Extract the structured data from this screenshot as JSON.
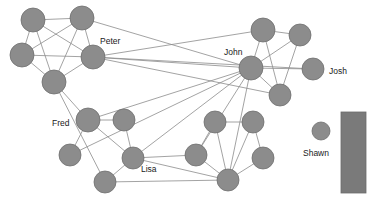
{
  "figure": {
    "width": 371,
    "height": 208,
    "background_color": "#ffffff"
  },
  "style": {
    "node_fill": "#8c8c8c",
    "node_stroke": "#6e6e6e",
    "edge_color": "#8c8c8c",
    "label_color": "#1a1a1a",
    "legend_fill": "#7a7a7a"
  },
  "labels": {
    "peter": "Peter",
    "john": "John",
    "josh": "Josh",
    "fred": "Fred",
    "lisa": "Lisa",
    "shawn": "Shawn"
  },
  "chart_data": {
    "type": "network",
    "node_count": 22,
    "edge_count": 42,
    "nodes": [
      {
        "id": "n1",
        "x": 33,
        "y": 20,
        "r": 12,
        "label": ""
      },
      {
        "id": "n2",
        "x": 82,
        "y": 18,
        "r": 12,
        "label": ""
      },
      {
        "id": "n3",
        "x": 22,
        "y": 55,
        "r": 12,
        "label": ""
      },
      {
        "id": "n4",
        "x": 93,
        "y": 57,
        "r": 12,
        "label": "Peter"
      },
      {
        "id": "n5",
        "x": 54,
        "y": 82,
        "r": 12,
        "label": ""
      },
      {
        "id": "n6",
        "x": 263,
        "y": 30,
        "r": 12,
        "label": ""
      },
      {
        "id": "n7",
        "x": 300,
        "y": 35,
        "r": 11,
        "label": ""
      },
      {
        "id": "n8",
        "x": 251,
        "y": 68,
        "r": 12,
        "label": "John"
      },
      {
        "id": "n9",
        "x": 313,
        "y": 69,
        "r": 11,
        "label": "Josh"
      },
      {
        "id": "n10",
        "x": 280,
        "y": 95,
        "r": 11,
        "label": ""
      },
      {
        "id": "n11",
        "x": 88,
        "y": 120,
        "r": 12,
        "label": "Fred"
      },
      {
        "id": "n12",
        "x": 124,
        "y": 120,
        "r": 11,
        "label": ""
      },
      {
        "id": "n13",
        "x": 70,
        "y": 155,
        "r": 11,
        "label": ""
      },
      {
        "id": "n14",
        "x": 133,
        "y": 158,
        "r": 11,
        "label": "Lisa"
      },
      {
        "id": "n15",
        "x": 105,
        "y": 182,
        "r": 11,
        "label": ""
      },
      {
        "id": "n16",
        "x": 215,
        "y": 122,
        "r": 11,
        "label": ""
      },
      {
        "id": "n17",
        "x": 253,
        "y": 122,
        "r": 11,
        "label": ""
      },
      {
        "id": "n18",
        "x": 196,
        "y": 155,
        "r": 11,
        "label": ""
      },
      {
        "id": "n19",
        "x": 263,
        "y": 158,
        "r": 11,
        "label": ""
      },
      {
        "id": "n20",
        "x": 228,
        "y": 180,
        "r": 11,
        "label": ""
      },
      {
        "id": "n21",
        "x": 321,
        "y": 131,
        "r": 9,
        "label": "Shawn"
      }
    ],
    "edges": [
      [
        "n1",
        "n2"
      ],
      [
        "n1",
        "n3"
      ],
      [
        "n1",
        "n4"
      ],
      [
        "n1",
        "n5"
      ],
      [
        "n2",
        "n3"
      ],
      [
        "n2",
        "n4"
      ],
      [
        "n2",
        "n5"
      ],
      [
        "n2",
        "n8"
      ],
      [
        "n3",
        "n4"
      ],
      [
        "n3",
        "n5"
      ],
      [
        "n4",
        "n5"
      ],
      [
        "n4",
        "n8"
      ],
      [
        "n4",
        "n6"
      ],
      [
        "n4",
        "n10"
      ],
      [
        "n4",
        "n9"
      ],
      [
        "n5",
        "n11"
      ],
      [
        "n5",
        "n15"
      ],
      [
        "n6",
        "n7"
      ],
      [
        "n6",
        "n8"
      ],
      [
        "n6",
        "n10"
      ],
      [
        "n7",
        "n8"
      ],
      [
        "n7",
        "n10"
      ],
      [
        "n8",
        "n9"
      ],
      [
        "n8",
        "n10"
      ],
      [
        "n8",
        "n11"
      ],
      [
        "n8",
        "n14"
      ],
      [
        "n8",
        "n13"
      ],
      [
        "n8",
        "n20"
      ],
      [
        "n8",
        "n18"
      ],
      [
        "n11",
        "n12"
      ],
      [
        "n11",
        "n13"
      ],
      [
        "n11",
        "n14"
      ],
      [
        "n12",
        "n14"
      ],
      [
        "n14",
        "n15"
      ],
      [
        "n14",
        "n18"
      ],
      [
        "n14",
        "n20"
      ],
      [
        "n15",
        "n20"
      ],
      [
        "n16",
        "n17"
      ],
      [
        "n16",
        "n18"
      ],
      [
        "n16",
        "n20"
      ],
      [
        "n17",
        "n20"
      ],
      [
        "n17",
        "n19"
      ],
      [
        "n18",
        "n20"
      ],
      [
        "n19",
        "n20"
      ]
    ],
    "label_positions": [
      {
        "text": "Peter",
        "x": 100,
        "y": 44,
        "anchor": "start"
      },
      {
        "text": "John",
        "x": 224,
        "y": 55,
        "anchor": "start"
      },
      {
        "text": "Josh",
        "x": 329,
        "y": 74,
        "anchor": "start"
      },
      {
        "text": "Fred",
        "x": 52,
        "y": 126,
        "anchor": "start"
      },
      {
        "text": "Lisa",
        "x": 141,
        "y": 172,
        "anchor": "start"
      },
      {
        "text": "Shawn",
        "x": 303,
        "y": 156,
        "anchor": "start"
      }
    ],
    "legend": {
      "type": "swatch-bar",
      "x": 341,
      "y": 112,
      "width": 25,
      "height": 81,
      "color": "#7a7a7a"
    }
  }
}
